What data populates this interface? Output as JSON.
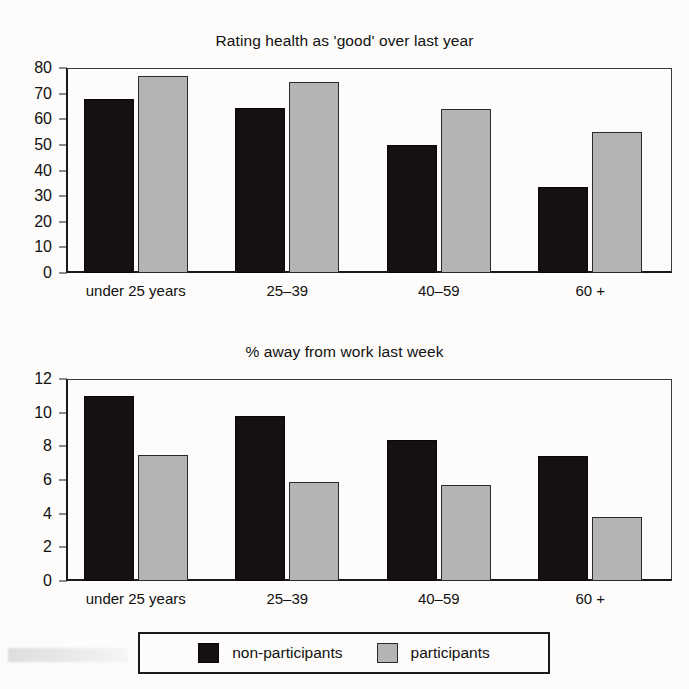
{
  "figure": {
    "background_color": "#fdfcfa",
    "series_colors": {
      "non_participants": "#151110",
      "participants": "#b4b4b4"
    }
  },
  "legend": {
    "entries": [
      {
        "label": "non-participants",
        "swatch": "dark-swatch"
      },
      {
        "label": "participants",
        "swatch": "light-swatch"
      }
    ]
  },
  "chart_data": [
    {
      "type": "bar",
      "title": "Rating health as 'good' over last year",
      "xlabel": "",
      "ylabel": "",
      "categories": [
        "under 25 years",
        "25–39",
        "40–59",
        "60 +"
      ],
      "series": [
        {
          "name": "non-participants",
          "values": [
            68,
            64.5,
            50,
            33.5
          ]
        },
        {
          "name": "participants",
          "values": [
            77,
            74.5,
            64,
            55
          ]
        }
      ],
      "ylim": [
        0,
        80
      ],
      "yticks": [
        0,
        10,
        20,
        30,
        40,
        50,
        60,
        70,
        80
      ],
      "ytick_labels": [
        "0",
        "10",
        "20",
        "30",
        "40",
        "50",
        "60",
        "70",
        "80"
      ],
      "grid": false,
      "legend_position": "bottom"
    },
    {
      "type": "bar",
      "title": "% away from work last week",
      "xlabel": "",
      "ylabel": "",
      "categories": [
        "under 25 years",
        "25–39",
        "40–59",
        "60 +"
      ],
      "series": [
        {
          "name": "non-participants",
          "values": [
            11.0,
            9.8,
            8.4,
            7.4
          ]
        },
        {
          "name": "participants",
          "values": [
            7.5,
            5.9,
            5.7,
            3.8
          ]
        }
      ],
      "ylim": [
        0,
        12
      ],
      "yticks": [
        0,
        2,
        4,
        6,
        8,
        10,
        12
      ],
      "ytick_labels": [
        "0",
        "2",
        "4",
        "6",
        "8",
        "10",
        "12"
      ],
      "grid": false,
      "legend_position": "bottom"
    }
  ]
}
